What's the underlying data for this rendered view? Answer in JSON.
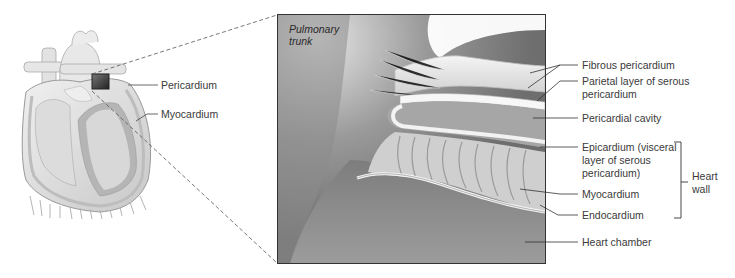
{
  "figure": {
    "overview": {
      "labels": {
        "pericardium": "Pericardium",
        "myocardium": "Myocardium"
      }
    },
    "detail": {
      "inset_label_line1": "Pulmonary",
      "inset_label_line2": "trunk",
      "labels": {
        "fibrous_pericardium": "Fibrous pericardium",
        "parietal_line1": "Parietal layer of serous",
        "parietal_line2": "pericardium",
        "pericardial_cavity": "Pericardial cavity",
        "epicardium_line1": "Epicardium (visceral",
        "epicardium_line2": "layer of serous",
        "epicardium_line3": "pericardium)",
        "myocardium": "Myocardium",
        "endocardium": "Endocardium",
        "heart_chamber": "Heart chamber"
      },
      "bracket_label_line1": "Heart",
      "bracket_label_line2": "wall"
    }
  }
}
